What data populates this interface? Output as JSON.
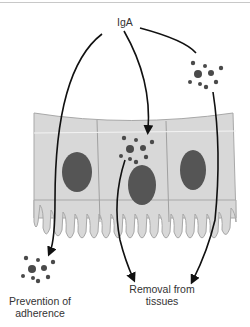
{
  "labels": {
    "iga": "IgA",
    "prevention_line1": "Prevention of",
    "prevention_line2": "adherence",
    "removal_line1": "Removal from",
    "removal_line2": "tissues"
  },
  "colors": {
    "cell_fill": "#d8d8d8",
    "cell_stroke": "#a8a8a8",
    "nucleus": "#555555",
    "particle": "#4a4a4a",
    "arrow": "#111111",
    "text": "#333333"
  }
}
